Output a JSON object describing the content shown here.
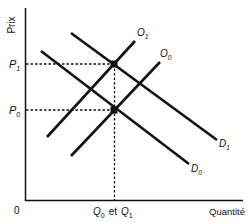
{
  "diagram": {
    "type": "supply-demand",
    "axes": {
      "y_label": "Prix",
      "x_label": "Quantité",
      "origin_label": "0"
    },
    "price_levels": [
      {
        "label": "P",
        "sub": "1"
      },
      {
        "label": "P",
        "sub": "0"
      }
    ],
    "quantity_label": {
      "q0": "Q",
      "q0_sub": "0",
      "conj": "et",
      "q1": "Q",
      "q1_sub": "1"
    },
    "curves": {
      "supply_1": {
        "label": "O",
        "sub": "1"
      },
      "supply_0": {
        "label": "O",
        "sub": "0"
      },
      "demand_1": {
        "label": "D",
        "sub": "1"
      },
      "demand_0": {
        "label": "D",
        "sub": "0"
      }
    },
    "colors": {
      "line": "#111111",
      "background": "#ffffff"
    }
  }
}
